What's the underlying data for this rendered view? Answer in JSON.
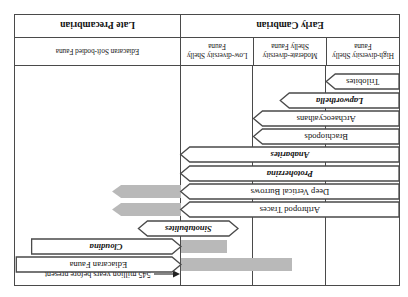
{
  "figure": {
    "annotation": {
      "text": "545 million years before present",
      "arrow_icon": "left-arrow-icon"
    },
    "period_bands": [
      {
        "label": "Early Cambrian",
        "left_pct": 0.0,
        "width_pct": 57.0
      },
      {
        "label": "Late Precambrian",
        "left_pct": 57.0,
        "width_pct": 43.0
      }
    ],
    "fauna_bands": [
      {
        "label": "High-diversity Shelly Fauna",
        "left_pct": 0.0,
        "width_pct": 19.0
      },
      {
        "label": "Moderate-diversity Shelly Fauna",
        "left_pct": 19.0,
        "width_pct": 19.0
      },
      {
        "label": "Low-diversity Shelly Fauna",
        "left_pct": 38.0,
        "width_pct": 19.0
      },
      {
        "label": "Ediacaran Soft-bodied Fauna",
        "left_pct": 57.0,
        "width_pct": 43.0
      }
    ],
    "boundary_pct": 57.0,
    "taxa": [
      {
        "name": "Trilobites",
        "italic": false,
        "start_pct": 0.0,
        "end_pct": 19.0,
        "head": "right",
        "ghost": null
      },
      {
        "name": "Lapworthella",
        "italic": true,
        "start_pct": 0.0,
        "end_pct": 31.0,
        "head": "right",
        "ghost": null
      },
      {
        "name": "Archaeocyathans",
        "italic": false,
        "start_pct": 0.0,
        "end_pct": 38.0,
        "head": "right",
        "ghost": null
      },
      {
        "name": "Brachiopods",
        "italic": false,
        "start_pct": 0.0,
        "end_pct": 38.0,
        "head": "right",
        "ghost": null
      },
      {
        "name": "Anabarites",
        "italic": true,
        "start_pct": 0.0,
        "end_pct": 57.0,
        "head": "right",
        "ghost": null
      },
      {
        "name": "Protoherzina",
        "italic": true,
        "start_pct": 0.0,
        "end_pct": 57.0,
        "head": "right",
        "ghost": null
      },
      {
        "name": "Deep Vertical Burrows",
        "italic": false,
        "start_pct": 0.0,
        "end_pct": 57.0,
        "head": "right",
        "ghost": {
          "start_pct": 57.0,
          "end_pct": 75.0
        }
      },
      {
        "name": "Arthropod Traces",
        "italic": false,
        "start_pct": 0.0,
        "end_pct": 57.0,
        "head": "right",
        "ghost": {
          "start_pct": 57.0,
          "end_pct": 75.0
        }
      },
      {
        "name": "Sinotubulites",
        "italic": true,
        "start_pct": 42.0,
        "end_pct": 68.0,
        "head": "both",
        "ghost": null
      },
      {
        "name": "Cloudina",
        "italic": true,
        "start_pct": 57.0,
        "end_pct": 96.0,
        "head": "left",
        "ghost": {
          "start_pct": 45.0,
          "end_pct": 57.0
        }
      },
      {
        "name": "Ediacaran Fauna",
        "italic": false,
        "start_pct": 57.0,
        "end_pct": 100.0,
        "head": "left",
        "ghost": {
          "start_pct": 28.0,
          "end_pct": 57.0
        }
      }
    ],
    "colors": {
      "line": "#4a4a4a",
      "text": "#111111",
      "ghost": "#b9b9b9",
      "background": "#ffffff"
    }
  }
}
